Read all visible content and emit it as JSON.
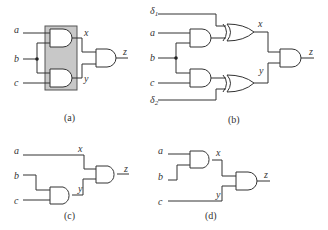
{
  "panels": {
    "a": {
      "caption": "(a)",
      "inputs": [
        "a",
        "b",
        "c"
      ],
      "intermediates": [
        "x",
        "y"
      ],
      "output": "z",
      "colors": {
        "highlight_box": "#c8c8c8"
      }
    },
    "b": {
      "caption": "(b)",
      "inputs": [
        "δ",
        "a",
        "b",
        "c",
        "δ"
      ],
      "subscripts": [
        "1",
        "2"
      ],
      "intermediates": [
        "x",
        "y"
      ],
      "output": "z"
    },
    "c": {
      "caption": "(c)",
      "inputs": [
        "a",
        "b",
        "c"
      ],
      "intermediates": [
        "x",
        "y"
      ],
      "output": "z"
    },
    "d": {
      "caption": "(d)",
      "inputs": [
        "a",
        "b",
        "c"
      ],
      "intermediates": [
        "x",
        "y"
      ],
      "output": "z"
    }
  }
}
